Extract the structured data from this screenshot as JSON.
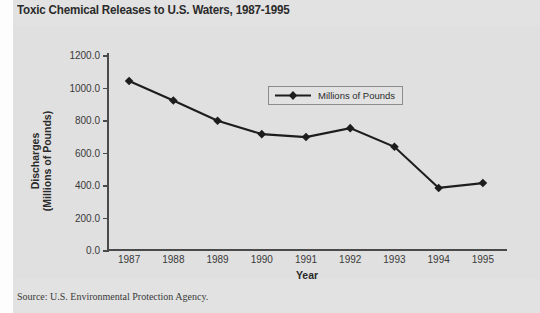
{
  "title": "Toxic Chemical Releases to U.S. Waters, 1987-1995",
  "source_note": "Source: U.S. Environmental Protection Agency.",
  "legend": {
    "label": "Millions of Pounds",
    "marker_icon": "diamond-marker-icon"
  },
  "colors": {
    "panel_background": "#e0e0e0",
    "page_background": "#e2e2e2",
    "axis": "#4a4a4a",
    "series_line": "#1d1d1d",
    "text": "#2b2b2b"
  },
  "chart_data": {
    "type": "line",
    "title": "Toxic Chemical Releases to U.S. Waters, 1987-1995",
    "xlabel": "Year",
    "ylabel": "Discharges (Millions of Pounds)",
    "ylabel_lines": [
      "Discharges",
      "(Millions of Pounds)"
    ],
    "categories": [
      "1987",
      "1988",
      "1989",
      "1990",
      "1991",
      "1992",
      "1993",
      "1994",
      "1995"
    ],
    "x": [
      1987,
      1988,
      1989,
      1990,
      1991,
      1992,
      1993,
      1994,
      1995
    ],
    "series": [
      {
        "name": "Millions of Pounds",
        "values": [
          1040,
          920,
          795,
          713,
          695,
          750,
          635,
          382,
          412
        ]
      }
    ],
    "ylim": [
      0.0,
      1200.0
    ],
    "ytick_labels": [
      "0.0",
      "200.0",
      "400.0",
      "600.0",
      "800.0",
      "1000.0",
      "1200.0"
    ],
    "ytick_values": [
      0,
      200,
      400,
      600,
      800,
      1000,
      1200
    ],
    "grid": false,
    "legend_position": "inside-upper-center",
    "marker": "diamond"
  }
}
